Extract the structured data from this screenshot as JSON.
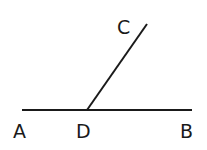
{
  "diagram": {
    "type": "geometry-angle",
    "stroke_color": "#1a1a1a",
    "points": {
      "A": {
        "label": "A",
        "x": 22,
        "y": 110
      },
      "B": {
        "label": "B",
        "x": 192,
        "y": 110
      },
      "D": {
        "label": "D",
        "x": 87,
        "y": 110
      },
      "C": {
        "label": "C",
        "x": 147,
        "y": 24
      }
    },
    "segments": [
      {
        "from": "A",
        "to": "B"
      },
      {
        "from": "D",
        "to": "C"
      }
    ],
    "labels": {
      "A": "A",
      "B": "B",
      "C": "C",
      "D": "D"
    }
  }
}
